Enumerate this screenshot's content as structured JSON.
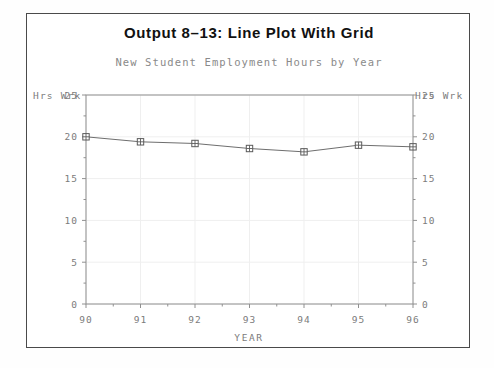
{
  "title": "Output 8–13:   Line Plot With Grid",
  "subtitle": "New Student Employment Hours by Year",
  "axis_labels": {
    "y_left": "Hrs Wrk",
    "y_right": "Hrs Wrk",
    "x": "YEAR"
  },
  "ticks": {
    "y": [
      "25",
      "20",
      "15",
      "10",
      "5",
      "0"
    ],
    "x": [
      "90",
      "91",
      "92",
      "93",
      "94",
      "95",
      "96"
    ]
  },
  "colors": {
    "frame": "#4a4a4a",
    "axis": "#909090",
    "grid": "#efefef",
    "line": "#6e6e6e",
    "marker": "#5a5a5a",
    "text_mono": "#7c7c7c",
    "title": "#111111",
    "subtitle": "#8a8a8a",
    "background": "#ffffff"
  },
  "chart_data": {
    "type": "line",
    "title": "Output 8–13:   Line Plot With Grid",
    "subtitle": "New Student Employment Hours by Year",
    "xlabel": "YEAR",
    "ylabel": "Hrs Wrk",
    "x": [
      90,
      91,
      92,
      93,
      94,
      95,
      96
    ],
    "xtick_labels": [
      "90",
      "91",
      "92",
      "93",
      "94",
      "95",
      "96"
    ],
    "values": [
      20.0,
      19.4,
      19.2,
      18.6,
      18.2,
      19.0,
      18.8
    ],
    "ytick_labels": [
      "0",
      "5",
      "10",
      "15",
      "20",
      "25"
    ],
    "ylim": [
      0,
      25
    ],
    "xlim": [
      90,
      96
    ],
    "yticks": [
      0,
      5,
      10,
      15,
      20,
      25
    ],
    "grid": true,
    "grid_axes": "both",
    "legend": false,
    "marker": "square-plus",
    "dual_y_axis": true,
    "series": [
      {
        "name": "Hrs Wrk",
        "values": [
          20.0,
          19.4,
          19.2,
          18.6,
          18.2,
          19.0,
          18.8
        ]
      }
    ]
  }
}
